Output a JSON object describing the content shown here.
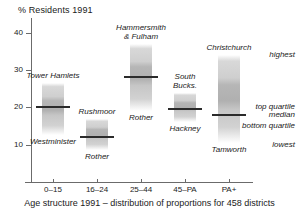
{
  "chart_data": {
    "type": "box",
    "title": "% Residents 1991",
    "xlabel": "Age structure 1991 – distribution of proportions for 458 districts",
    "ylabel": "% Residents 1991",
    "ylim": [
      0,
      44
    ],
    "yticks": [
      10,
      20,
      30,
      40
    ],
    "grid": false,
    "legend_position": "right",
    "categories": [
      "0–15",
      "16–24",
      "25–44",
      "45–PA",
      "PA+"
    ],
    "legend": [
      {
        "key": "highest",
        "label": "highest"
      },
      {
        "key": "top_quartile",
        "label": "top quartile"
      },
      {
        "key": "median",
        "label": "median"
      },
      {
        "key": "bottom_quartile",
        "label": "bottom quartile"
      },
      {
        "key": "lowest",
        "label": "lowest"
      }
    ],
    "series": [
      {
        "category": "0–15",
        "highest": 26.5,
        "top_quartile": 22.0,
        "median": 20.0,
        "bottom_quartile": 18.4,
        "lowest": 12.5,
        "highest_label": "Tower Hamlets",
        "lowest_label": "Westminister"
      },
      {
        "category": "16–24",
        "highest": 17.0,
        "top_quartile": 13.6,
        "median": 12.2,
        "bottom_quartile": 11.4,
        "lowest": 8.5,
        "highest_label": "Rushmoor",
        "lowest_label": "Rother"
      },
      {
        "category": "25–44",
        "highest": 37.0,
        "top_quartile": 30.0,
        "median": 28.2,
        "bottom_quartile": 26.4,
        "lowest": 19.0,
        "highest_label": "Hammersmith\n& Fulham",
        "lowest_label": "Rother"
      },
      {
        "category": "45–PA",
        "highest": 24.0,
        "top_quartile": 20.8,
        "median": 19.5,
        "bottom_quartile": 18.4,
        "lowest": 16.0,
        "highest_label": "South\nBucks.",
        "lowest_label": "Hackney"
      },
      {
        "category": "PA+",
        "highest": 34.0,
        "top_quartile": 20.6,
        "median": 18.0,
        "bottom_quartile": 15.8,
        "lowest": 10.5,
        "highest_label": "Christchurch",
        "lowest_label": "Tamworth"
      }
    ]
  },
  "colors": {
    "axis": "#6b6b6b",
    "median_line": "#2b2b2b",
    "bar_fill": "#c6c6c6",
    "bar_quartile": "#b0b0b0",
    "text": "#1a1a1a",
    "background": "#ffffff"
  }
}
